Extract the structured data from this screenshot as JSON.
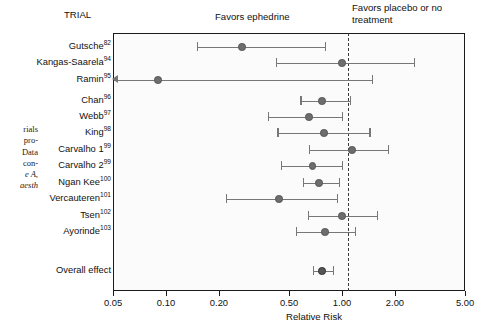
{
  "figure": {
    "trial_column_header": "TRIAL",
    "favors_left_label": "Favors ephedrine",
    "favors_right_label": "Favors placebo or no treatment",
    "x_axis_title": "Relative Risk",
    "overall_label": "Overall effect",
    "margin_text_lines": [
      "rials",
      "pro-",
      "Data",
      "con-",
      "e A,",
      "aesth"
    ]
  },
  "chart_data": {
    "type": "forest",
    "title": "",
    "xlabel": "Relative Risk",
    "ylabel": "",
    "xscale": "log",
    "xlim": [
      0.05,
      5.0
    ],
    "xticks": [
      0.05,
      0.1,
      0.2,
      0.5,
      1.0,
      2.0,
      5.0
    ],
    "xticklabels": [
      "0.05",
      "0.10",
      "0.20",
      "0.50",
      "1.00",
      "2.00",
      "5.00"
    ],
    "null_line": 1.0,
    "grid": false,
    "legend": "none",
    "annotations": [
      "Favors ephedrine",
      "Favors placebo or no treatment"
    ],
    "categories": [
      "Gutsche",
      "Kangas-Saarela",
      "Ramin",
      "Chan",
      "Webb",
      "King",
      "Carvalho 1",
      "Carvalho 2",
      "Ngan Kee",
      "Vercauteren",
      "Tsen",
      "Ayorinde",
      "Overall effect"
    ],
    "rows": [
      {
        "label": "Gutsche",
        "ref": "82",
        "rr": 0.27,
        "lo": 0.15,
        "hi": 0.8,
        "arrow_low": false,
        "summary": false
      },
      {
        "label": "Kangas-Saarela",
        "ref": "94",
        "rr": 1.0,
        "lo": 0.42,
        "hi": 2.55,
        "arrow_low": false,
        "summary": false
      },
      {
        "label": "Ramin",
        "ref": "95",
        "rr": 0.09,
        "lo": 0.05,
        "hi": 1.48,
        "arrow_low": true,
        "summary": false
      },
      {
        "label": "Chan",
        "ref": "96",
        "rr": 0.77,
        "lo": 0.58,
        "hi": 1.11,
        "arrow_low": false,
        "summary": false
      },
      {
        "label": "Webb",
        "ref": "97",
        "rr": 0.65,
        "lo": 0.38,
        "hi": 1.0,
        "arrow_low": false,
        "summary": false
      },
      {
        "label": "King",
        "ref": "98",
        "rr": 0.79,
        "lo": 0.43,
        "hi": 1.43,
        "arrow_low": false,
        "summary": false
      },
      {
        "label": "Carvalho 1",
        "ref": "99",
        "rr": 1.14,
        "lo": 0.65,
        "hi": 1.82,
        "arrow_low": false,
        "summary": false
      },
      {
        "label": "Carvalho 2",
        "ref": "99",
        "rr": 0.68,
        "lo": 0.45,
        "hi": 1.0,
        "arrow_low": false,
        "summary": false
      },
      {
        "label": "Ngan Kee",
        "ref": "100",
        "rr": 0.74,
        "lo": 0.6,
        "hi": 0.96,
        "arrow_low": false,
        "summary": false
      },
      {
        "label": "Vercauteren",
        "ref": "101",
        "rr": 0.44,
        "lo": 0.22,
        "hi": 0.94,
        "arrow_low": false,
        "summary": false
      },
      {
        "label": "Tsen",
        "ref": "102",
        "rr": 1.0,
        "lo": 0.64,
        "hi": 1.58,
        "arrow_low": false,
        "summary": false
      },
      {
        "label": "Ayorinde",
        "ref": "103",
        "rr": 0.8,
        "lo": 0.55,
        "hi": 1.18,
        "arrow_low": false,
        "summary": false
      },
      {
        "label": "Overall effect",
        "ref": "",
        "rr": 0.77,
        "lo": 0.68,
        "hi": 0.89,
        "arrow_low": false,
        "summary": true
      }
    ]
  },
  "colors": {
    "marker": "#6d6d6d",
    "summary_marker": "#555555",
    "ci_line": "#777777",
    "frame": "#1a1a1a",
    "null_line": "#3a3a3a",
    "text": "#111111",
    "plot_background": "#fbfbfb"
  }
}
